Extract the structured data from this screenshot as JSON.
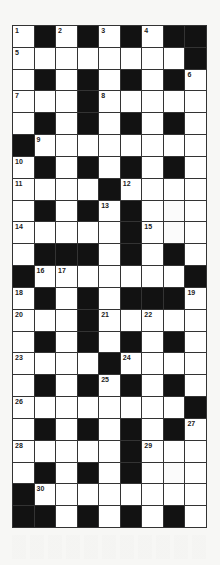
{
  "puzzle": {
    "type": "crossword",
    "columns": 9,
    "rows": 23,
    "legend": {
      "#": "black square",
      ".": "white square"
    },
    "colors": {
      "block": "#121212",
      "cell": "#ffffff",
      "grid_line": "#333333"
    },
    "layout_rows": [
      ".#.#.#.##",
      "........#",
      ".#.#.#.#.",
      "...#.....",
      ".#.#.#.#.",
      "#........",
      ".#.#.#.#.",
      "....#....",
      ".#.#.#...",
      ".....#...",
      ".###.#.#.",
      "#.......#",
      ".#.#.###.",
      "...#.....",
      ".#.#.#.#.",
      "....#....",
      ".#.#.#.#.",
      "........#",
      ".#.#.#.#.",
      ".....#...",
      ".#.#.#...",
      "#........",
      "##.#.#.#."
    ],
    "numbers": [
      {
        "row": 0,
        "col": 0,
        "n": "1"
      },
      {
        "row": 0,
        "col": 2,
        "n": "2"
      },
      {
        "row": 0,
        "col": 4,
        "n": "3"
      },
      {
        "row": 0,
        "col": 6,
        "n": "4"
      },
      {
        "row": 1,
        "col": 0,
        "n": "5"
      },
      {
        "row": 2,
        "col": 8,
        "n": "6"
      },
      {
        "row": 3,
        "col": 0,
        "n": "7"
      },
      {
        "row": 3,
        "col": 4,
        "n": "8"
      },
      {
        "row": 5,
        "col": 1,
        "n": "9"
      },
      {
        "row": 6,
        "col": 0,
        "n": "10"
      },
      {
        "row": 7,
        "col": 0,
        "n": "11"
      },
      {
        "row": 7,
        "col": 5,
        "n": "12"
      },
      {
        "row": 8,
        "col": 4,
        "n": "13"
      },
      {
        "row": 9,
        "col": 0,
        "n": "14"
      },
      {
        "row": 9,
        "col": 6,
        "n": "15"
      },
      {
        "row": 11,
        "col": 1,
        "n": "16"
      },
      {
        "row": 11,
        "col": 2,
        "n": "17"
      },
      {
        "row": 12,
        "col": 0,
        "n": "18"
      },
      {
        "row": 12,
        "col": 8,
        "n": "19"
      },
      {
        "row": 13,
        "col": 0,
        "n": "20"
      },
      {
        "row": 13,
        "col": 4,
        "n": "21"
      },
      {
        "row": 13,
        "col": 6,
        "n": "22"
      },
      {
        "row": 15,
        "col": 0,
        "n": "23"
      },
      {
        "row": 15,
        "col": 5,
        "n": "24"
      },
      {
        "row": 16,
        "col": 4,
        "n": "25"
      },
      {
        "row": 17,
        "col": 0,
        "n": "26"
      },
      {
        "row": 18,
        "col": 8,
        "n": "27"
      },
      {
        "row": 19,
        "col": 0,
        "n": "28"
      },
      {
        "row": 19,
        "col": 6,
        "n": "29"
      },
      {
        "row": 21,
        "col": 1,
        "n": "30"
      }
    ],
    "faded_cells": [
      {
        "row": 8,
        "col": 7
      },
      {
        "row": 9,
        "col": 7
      },
      {
        "row": 20,
        "col": 7
      }
    ]
  }
}
